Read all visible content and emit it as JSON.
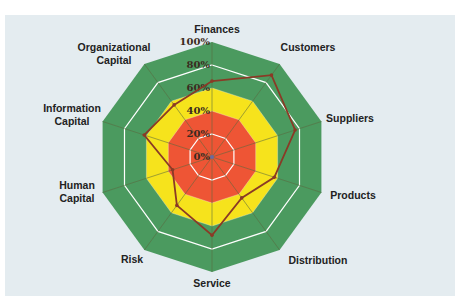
{
  "chart_data": {
    "type": "radar",
    "title": "",
    "categories": [
      "Finances",
      "Customers",
      "Suppliers",
      "Products",
      "Distribution",
      "Service",
      "Risk",
      "Human Capital",
      "Information Capital",
      "Organizational Capital"
    ],
    "category_lines": [
      [
        "Finances"
      ],
      [
        "Customers"
      ],
      [
        "Suppliers"
      ],
      [
        "Products"
      ],
      [
        "Distribution"
      ],
      [
        "Service"
      ],
      [
        "Risk"
      ],
      [
        "Human",
        "Capital"
      ],
      [
        "Information",
        "Capital"
      ],
      [
        "Organizational",
        "Capital"
      ]
    ],
    "series": [
      {
        "name": "Score",
        "values": [
          66,
          88,
          76,
          57,
          44,
          68,
          52,
          36,
          62,
          56
        ]
      }
    ],
    "radial_ticks": [
      "0%",
      "20%",
      "40%",
      "60%",
      "80%",
      "100%"
    ],
    "rlim": [
      0,
      100
    ],
    "zones": [
      {
        "from": 0,
        "to": 40,
        "color": "#ee5535"
      },
      {
        "from": 40,
        "to": 60,
        "color": "#f6e31c"
      },
      {
        "from": 60,
        "to": 100,
        "color": "#4b9a5f"
      }
    ],
    "line_color": "#8a3a26",
    "grid": true,
    "legend": "none"
  }
}
